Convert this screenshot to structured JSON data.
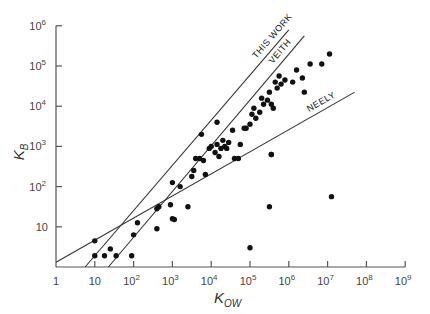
{
  "chart_data": {
    "type": "scatter",
    "title": "",
    "xlabel": "K_OW",
    "ylabel": "K_B",
    "xscale": "log",
    "yscale": "log",
    "xlim": [
      1,
      1000000000
    ],
    "ylim": [
      1,
      1000000
    ],
    "grid": false,
    "legend": "none (lines labelled inline)",
    "x_ticks": [
      {
        "value": 1,
        "label": "1"
      },
      {
        "value": 10,
        "label": "10"
      },
      {
        "value": 100,
        "label": "10",
        "sup": "2"
      },
      {
        "value": 1000,
        "label": "10",
        "sup": "3"
      },
      {
        "value": 10000,
        "label": "10",
        "sup": "4"
      },
      {
        "value": 100000,
        "label": "10",
        "sup": "5"
      },
      {
        "value": 1000000,
        "label": "10",
        "sup": "6"
      },
      {
        "value": 10000000,
        "label": "10",
        "sup": "7"
      },
      {
        "value": 100000000,
        "label": "10",
        "sup": "8"
      },
      {
        "value": 1000000000,
        "label": "10",
        "sup": "9"
      }
    ],
    "y_ticks": [
      {
        "value": 10,
        "label": "10"
      },
      {
        "value": 100,
        "label": "10",
        "sup": "2"
      },
      {
        "value": 1000,
        "label": "10",
        "sup": "3"
      },
      {
        "value": 10000,
        "label": "10",
        "sup": "4"
      },
      {
        "value": 100000,
        "label": "10",
        "sup": "5"
      },
      {
        "value": 1000000,
        "label": "10",
        "sup": "6"
      }
    ],
    "lines": [
      {
        "name": "THIS WORK",
        "log_points": [
          [
            0.75,
            0
          ],
          [
            6.0,
            5.9
          ]
        ]
      },
      {
        "name": "VEITH",
        "log_points": [
          [
            1.35,
            0
          ],
          [
            6.4,
            5.75
          ]
        ]
      },
      {
        "name": "NEELY",
        "log_points": [
          [
            0,
            0.12
          ],
          [
            7.7,
            4.35
          ]
        ]
      }
    ],
    "points_log10": [
      [
        1.0,
        0.65
      ],
      [
        1.0,
        0.28
      ],
      [
        1.25,
        0.28
      ],
      [
        1.4,
        0.45
      ],
      [
        1.55,
        0.28
      ],
      [
        1.95,
        0.28
      ],
      [
        2.0,
        0.8
      ],
      [
        2.1,
        1.1
      ],
      [
        2.6,
        1.45
      ],
      [
        2.6,
        0.95
      ],
      [
        2.65,
        1.5
      ],
      [
        2.95,
        1.55
      ],
      [
        3.0,
        2.1
      ],
      [
        3.0,
        1.2
      ],
      [
        3.05,
        1.18
      ],
      [
        3.2,
        2.0
      ],
      [
        3.4,
        1.5
      ],
      [
        3.5,
        2.25
      ],
      [
        3.55,
        2.4
      ],
      [
        3.6,
        2.7
      ],
      [
        3.75,
        3.3
      ],
      [
        3.7,
        2.7
      ],
      [
        3.8,
        2.65
      ],
      [
        3.85,
        2.3
      ],
      [
        3.95,
        2.95
      ],
      [
        4.0,
        3.0
      ],
      [
        4.1,
        2.85
      ],
      [
        4.15,
        3.6
      ],
      [
        4.15,
        3.05
      ],
      [
        4.2,
        2.75
      ],
      [
        4.25,
        2.95
      ],
      [
        4.3,
        3.15
      ],
      [
        4.35,
        3.0
      ],
      [
        4.4,
        2.95
      ],
      [
        4.45,
        3.1
      ],
      [
        4.55,
        3.4
      ],
      [
        4.6,
        2.7
      ],
      [
        4.7,
        2.7
      ],
      [
        4.75,
        3.05
      ],
      [
        4.85,
        3.45
      ],
      [
        4.9,
        3.45
      ],
      [
        5.0,
        3.55
      ],
      [
        5.05,
        3.8
      ],
      [
        5.1,
        3.95
      ],
      [
        5.15,
        3.7
      ],
      [
        5.25,
        3.85
      ],
      [
        5.3,
        4.2
      ],
      [
        5.35,
        4.05
      ],
      [
        5.45,
        4.15
      ],
      [
        5.5,
        4.35
      ],
      [
        5.55,
        4.05
      ],
      [
        5.6,
        3.95
      ],
      [
        5.55,
        2.8
      ],
      [
        5.65,
        4.6
      ],
      [
        5.7,
        4.45
      ],
      [
        5.75,
        4.75
      ],
      [
        5.8,
        4.55
      ],
      [
        5.9,
        4.65
      ],
      [
        6.1,
        4.6
      ],
      [
        6.2,
        4.9
      ],
      [
        6.35,
        4.7
      ],
      [
        6.4,
        4.35
      ],
      [
        6.55,
        5.05
      ],
      [
        6.85,
        5.05
      ],
      [
        7.05,
        5.3
      ],
      [
        5.0,
        0.48
      ],
      [
        5.5,
        1.5
      ],
      [
        5.55,
        2.8
      ],
      [
        7.1,
        1.75
      ]
    ]
  }
}
